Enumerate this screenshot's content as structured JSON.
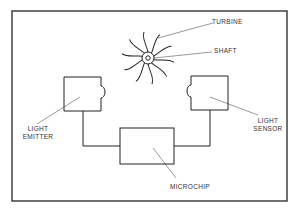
{
  "diagram": {
    "type": "schematic",
    "labels": {
      "turbine": "TURBINE",
      "shaft": "SHAFT",
      "light_emitter_line1": "LIGHT",
      "light_emitter_line2": "EMITTER",
      "light_sensor_line1": "LIGHT",
      "light_sensor_line2": "SENSOR",
      "microchip": "MICROCHIP"
    },
    "components": [
      "turbine",
      "shaft",
      "light emitter",
      "light sensor",
      "microchip"
    ],
    "connections": [
      {
        "from": "light emitter",
        "to": "microchip"
      },
      {
        "from": "light sensor",
        "to": "microchip"
      }
    ],
    "colors": {
      "line": "#222222",
      "leader": "#555555",
      "background": "#ffffff"
    }
  }
}
